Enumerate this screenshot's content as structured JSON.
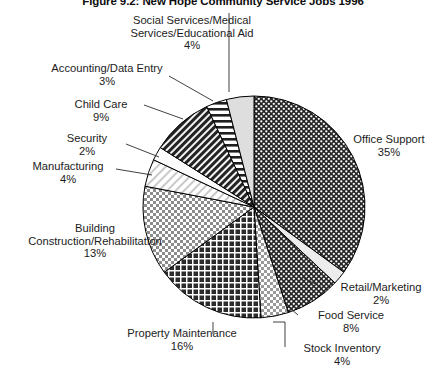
{
  "title": "Figure 9.2: New Hope Community Service Jobs 1996",
  "chart_data": {
    "type": "pie",
    "title": "Figure 9.2: New Hope Community Service Jobs 1996",
    "xlabel": "",
    "ylabel": "",
    "legend_position": "none",
    "grid": false,
    "units": "percent",
    "start_angle_deg": 0,
    "direction": "clockwise",
    "categories": [
      "Office Support",
      "Retail/Marketing",
      "Food Service",
      "Stock Inventory",
      "Property Maintenance",
      "Building Construction/Rehabilitation",
      "Manufacturing",
      "Security",
      "Child Care",
      "Accounting/Data Entry",
      "Social Services/Medical Services/Educational Aid"
    ],
    "values": [
      35,
      2,
      8,
      4,
      16,
      13,
      4,
      2,
      9,
      3,
      4
    ],
    "slices": [
      {
        "name": "Office Support",
        "value": 35,
        "value_label": "35%",
        "label_line1": "Office Support",
        "pattern": "dark-dots",
        "fill": "#2b2b2b"
      },
      {
        "name": "Retail/Marketing",
        "value": 2,
        "value_label": "2%",
        "label_line1": "Retail/Marketing",
        "pattern": "light-plain",
        "fill": "#eaeaea"
      },
      {
        "name": "Food Service",
        "value": 8,
        "value_label": "8%",
        "label_line1": "Food Service",
        "pattern": "dark-dots",
        "fill": "#303030"
      },
      {
        "name": "Stock Inventory",
        "value": 4,
        "value_label": "4%",
        "label_line1": "Stock Inventory",
        "pattern": "light-checker",
        "fill": "#f0f0f0"
      },
      {
        "name": "Property Maintenance",
        "value": 16,
        "value_label": "16%",
        "label_line1": "Property Maintenance",
        "pattern": "dark-crosshatch",
        "fill": "#3a3a3a"
      },
      {
        "name": "Building Construction/Rehabilitation",
        "value": 13,
        "value_label": "13%",
        "label_line1": "Building",
        "label_line2": "Construction/Rehabilitation",
        "pattern": "medium-checker",
        "fill": "#b5b5b5"
      },
      {
        "name": "Manufacturing",
        "value": 4,
        "value_label": "4%",
        "label_line1": "Manufacturing",
        "pattern": "light-diagonal",
        "fill": "#e4e4e4"
      },
      {
        "name": "Security",
        "value": 2,
        "value_label": "2%",
        "label_line1": "Security",
        "pattern": "white-plain",
        "fill": "#fbfbfb"
      },
      {
        "name": "Child Care",
        "value": 9,
        "value_label": "9%",
        "label_line1": "Child Care",
        "pattern": "dark-diagonal",
        "fill": "#2e2e2e"
      },
      {
        "name": "Accounting/Data Entry",
        "value": 3,
        "value_label": "3%",
        "label_line1": "Accounting/Data Entry",
        "pattern": "horizontal-stripes",
        "fill": "#f2f2f2"
      },
      {
        "name": "Social Services/Medical Services/Educational Aid",
        "value": 4,
        "value_label": "4%",
        "label_line1": "Social Services/Medical",
        "label_line2": "Services/Educational Aid",
        "pattern": "light-gray",
        "fill": "#dcdcdc"
      }
    ]
  },
  "colors": {
    "outline": "#000000",
    "text": "#1c1c1c",
    "background": "#ffffff"
  }
}
